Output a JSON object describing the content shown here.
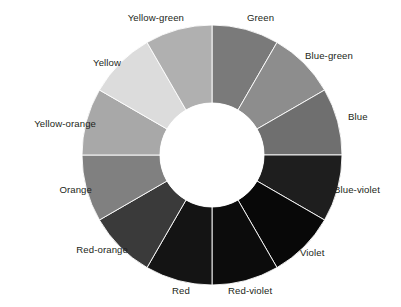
{
  "figure": {
    "name": "color-wheel",
    "background": "#ffffff",
    "label_color": "#231f20",
    "segment_border_color": "#ffffff",
    "hub_color": "#ffffff"
  },
  "geometry": {
    "center_x": 212,
    "center_y": 155,
    "outer_radius": 130,
    "inner_radius": 52,
    "segment_count": 12,
    "segment_span_degrees": 30,
    "first_segment_start_degrees": 0
  },
  "chart_data": {
    "type": "pie",
    "categories": [
      "Green",
      "Blue-green",
      "Blue",
      "Blue-violet",
      "Violet",
      "Red-violet",
      "Red",
      "Red-orange",
      "Orange",
      "Yellow-orange",
      "Yellow",
      "Yellow-green"
    ],
    "values": [
      30,
      30,
      30,
      30,
      30,
      30,
      30,
      30,
      30,
      30,
      30,
      30
    ],
    "colors": [
      "#7a7a7a",
      "#8d8d8d",
      "#6f6f6f",
      "#1e1e1e",
      "#080808",
      "#0c0c0c",
      "#141414",
      "#3a3a3a",
      "#808080",
      "#a8a8a8",
      "#dcdcdc",
      "#b0b0b0"
    ],
    "legend": "none",
    "grid": false
  },
  "segments": [
    {
      "id": "green",
      "label": "Green",
      "color": "#7a7a7a",
      "start_angle": 0,
      "end_angle": 30,
      "label_x": 247,
      "label_y": 18,
      "anchor": "start"
    },
    {
      "id": "blue-green",
      "label": "Blue-green",
      "color": "#8d8d8d",
      "start_angle": 30,
      "end_angle": 60,
      "label_x": 305,
      "label_y": 56,
      "anchor": "start"
    },
    {
      "id": "blue",
      "label": "Blue",
      "color": "#6f6f6f",
      "start_angle": 60,
      "end_angle": 90,
      "label_x": 348,
      "label_y": 117,
      "anchor": "start"
    },
    {
      "id": "blue-violet",
      "label": "Blue-violet",
      "color": "#1e1e1e",
      "start_angle": 90,
      "end_angle": 120,
      "label_x": 334,
      "label_y": 190,
      "anchor": "start"
    },
    {
      "id": "violet",
      "label": "Violet",
      "color": "#080808",
      "start_angle": 120,
      "end_angle": 150,
      "label_x": 300,
      "label_y": 253,
      "anchor": "start"
    },
    {
      "id": "red-violet",
      "label": "Red-violet",
      "color": "#0c0c0c",
      "start_angle": 150,
      "end_angle": 180,
      "label_x": 228,
      "label_y": 291,
      "anchor": "start"
    },
    {
      "id": "red",
      "label": "Red",
      "color": "#141414",
      "start_angle": 180,
      "end_angle": 210,
      "label_x": 172,
      "label_y": 291,
      "anchor": "start"
    },
    {
      "id": "red-orange",
      "label": "Red-orange",
      "color": "#3a3a3a",
      "start_angle": 210,
      "end_angle": 240,
      "label_x": 128,
      "label_y": 250,
      "anchor": "end"
    },
    {
      "id": "orange",
      "label": "Orange",
      "color": "#808080",
      "start_angle": 240,
      "end_angle": 270,
      "label_x": 92,
      "label_y": 190,
      "anchor": "end"
    },
    {
      "id": "yellow-orange",
      "label": "Yellow-orange",
      "color": "#a8a8a8",
      "start_angle": 270,
      "end_angle": 300,
      "label_x": 96,
      "label_y": 124,
      "anchor": "end"
    },
    {
      "id": "yellow",
      "label": "Yellow",
      "color": "#dcdcdc",
      "start_angle": 300,
      "end_angle": 330,
      "label_x": 121,
      "label_y": 63,
      "anchor": "end"
    },
    {
      "id": "yellow-green",
      "label": "Yellow-green",
      "color": "#b0b0b0",
      "start_angle": 330,
      "end_angle": 360,
      "label_x": 184,
      "label_y": 18,
      "anchor": "end"
    }
  ]
}
